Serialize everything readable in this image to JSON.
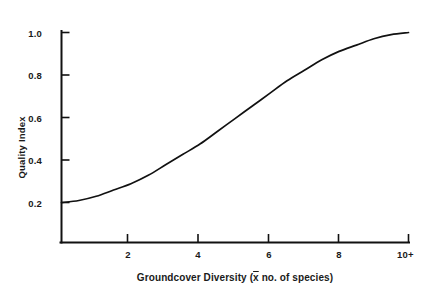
{
  "chart_data": {
    "type": "line",
    "title": "",
    "subtitle": "",
    "xlabel_prefix": "Groundcover Diversity (",
    "xlabel_bar_symbol": "x",
    "xlabel_suffix": " no. of species)",
    "xlabel_full": "Groundcover Diversity (x̄ no. of species)",
    "ylabel": "Quality Index",
    "xlim": [
      0,
      10
    ],
    "ylim": [
      0,
      1.0
    ],
    "grid": false,
    "legend": "none",
    "xticks": [
      2,
      4,
      6,
      8,
      10
    ],
    "xtick_labels": [
      "2",
      "4",
      "6",
      "8",
      "10+"
    ],
    "yticks": [
      0.2,
      0.4,
      0.6,
      0.8,
      1.0
    ],
    "ytick_labels": [
      "0.2",
      "0.4",
      "0.6",
      "0.8",
      "1.0"
    ],
    "series": [
      {
        "name": "Quality Index",
        "color": "#111111",
        "x": [
          0,
          0.5,
          1,
          1.5,
          2,
          2.5,
          3,
          3.5,
          4,
          4.5,
          5,
          5.5,
          6,
          6.5,
          7,
          7.5,
          8,
          8.5,
          9,
          9.5,
          10
        ],
        "values": [
          0.19,
          0.2,
          0.22,
          0.25,
          0.28,
          0.32,
          0.37,
          0.42,
          0.47,
          0.53,
          0.59,
          0.65,
          0.71,
          0.77,
          0.82,
          0.87,
          0.91,
          0.94,
          0.97,
          0.99,
          1.0
        ]
      }
    ],
    "annotations": []
  },
  "figure": {
    "background_color": "#ffffff",
    "line_color": "#111111",
    "axis_color": "#111111"
  }
}
